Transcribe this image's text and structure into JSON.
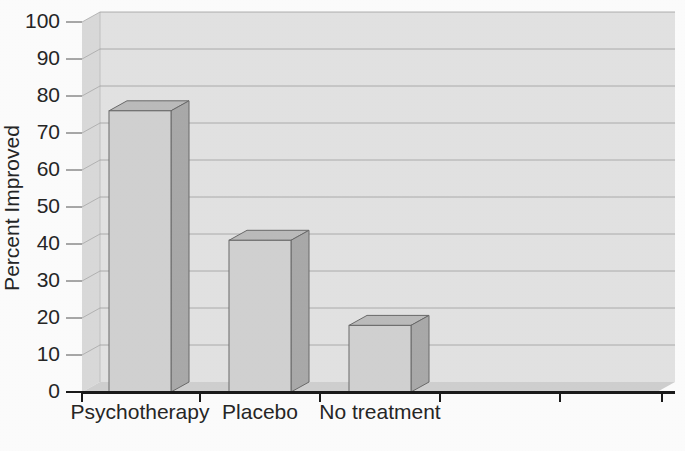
{
  "chart_data": {
    "type": "bar",
    "title": "",
    "subtitle": "",
    "xlabel": "",
    "ylabel": "Percent Improved",
    "categories": [
      "Psychotherapy",
      "Placebo",
      "No treatment"
    ],
    "values": [
      76,
      41,
      18
    ],
    "series": [
      {
        "name": "Percent Improved",
        "values": [
          76,
          41,
          18
        ]
      }
    ],
    "ylim": [
      0,
      100
    ],
    "ytick_labels": [
      "0",
      "10",
      "20",
      "30",
      "40",
      "50",
      "60",
      "70",
      "80",
      "90",
      "100"
    ],
    "ytick_values": [
      0,
      10,
      20,
      30,
      40,
      50,
      60,
      70,
      80,
      90,
      100
    ],
    "grid": true,
    "grid_axis": "y",
    "legend": "none",
    "style": "3d-bar",
    "colors": {
      "bar_front": "#d2d2d2",
      "bar_side": "#aaaaaa",
      "bar_top": "#bcbcbc",
      "bar_edge": "#6a6a6a",
      "wall_back": "#e2e2e2",
      "wall_left": "#d8d8d8",
      "floor": "#cfcfcf",
      "gridline": "#9a9a9a",
      "axis": "#1a1a1a",
      "text": "#262626",
      "background": "#fdfdfd"
    }
  }
}
